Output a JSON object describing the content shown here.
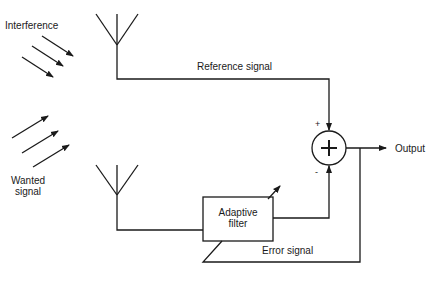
{
  "diagram": {
    "labels": {
      "interference": "Interference",
      "wanted_signal_line1": "Wanted",
      "wanted_signal_line2": "signal",
      "reference_signal": "Reference signal",
      "adaptive_filter_line1": "Adaptive",
      "adaptive_filter_line2": "filter",
      "error_signal": "Error signal",
      "output": "Output",
      "summer_symbol": "+",
      "plus_input": "+",
      "minus_input": "-"
    },
    "colors": {
      "stroke": "#1a1a1a",
      "background": "#ffffff"
    }
  }
}
